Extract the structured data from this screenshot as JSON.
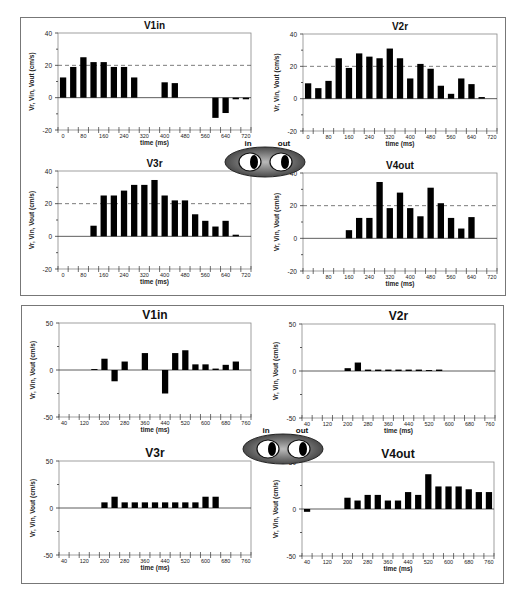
{
  "panels": [
    {
      "id": "top",
      "frame": {
        "x": 20,
        "y": 17,
        "w": 486,
        "h": 279
      },
      "eyes": {
        "x": 222,
        "y": 138,
        "in_label": "in",
        "out_label": "out"
      },
      "ylim": [
        -20,
        40
      ],
      "yticks": [
        -20,
        0,
        20,
        40
      ],
      "xticks": [
        "0",
        "80",
        "160",
        "240",
        "320",
        "400",
        "480",
        "560",
        "640",
        "720"
      ],
      "reference_line": 20
    },
    {
      "id": "bottom",
      "frame": {
        "x": 21,
        "y": 305,
        "w": 483,
        "h": 279
      },
      "eyes": {
        "x": 240,
        "y": 425,
        "in_label": "in",
        "out_label": "out"
      },
      "ylim": [
        -50,
        50
      ],
      "yticks": [
        -50,
        0,
        50
      ],
      "xticks": [
        "40",
        "120",
        "200",
        "280",
        "360",
        "440",
        "520",
        "600",
        "680",
        "760"
      ],
      "reference_line": null
    }
  ],
  "chart_data": [
    {
      "type": "bar",
      "panel": "top",
      "title": "V1in",
      "xlabel": "time (ms)",
      "ylabel": "Vr, Vin, Vout (cm/s)",
      "ylim": [
        -20,
        40
      ],
      "reference_line": 20,
      "x": [
        0,
        40,
        80,
        120,
        160,
        200,
        240,
        280,
        320,
        360,
        400,
        440,
        480,
        520,
        560,
        600,
        640,
        680,
        720
      ],
      "values": [
        12.5,
        19,
        25,
        22,
        22,
        19,
        19,
        12.5,
        0,
        0,
        9.5,
        9,
        0,
        0,
        0,
        -12.5,
        -9.5,
        -1,
        -1
      ],
      "box": {
        "x": 58,
        "y": 33,
        "w": 193,
        "h": 97
      }
    },
    {
      "type": "bar",
      "panel": "top",
      "title": "V2r",
      "xlabel": "time (ms)",
      "ylabel": "Vr, Vin, Vout (cm/s)",
      "ylim": [
        -20,
        40
      ],
      "reference_line": 20,
      "x": [
        0,
        40,
        80,
        120,
        160,
        200,
        240,
        280,
        320,
        360,
        400,
        440,
        480,
        520,
        560,
        600,
        640,
        680,
        720
      ],
      "values": [
        9.5,
        6.5,
        11,
        25,
        19,
        28,
        26,
        25,
        31,
        25,
        12.5,
        21.5,
        18.5,
        8,
        3,
        12.5,
        9,
        1,
        0
      ],
      "box": {
        "x": 303,
        "y": 34,
        "w": 194,
        "h": 97
      }
    },
    {
      "type": "bar",
      "panel": "top",
      "title": "V3r",
      "xlabel": "time (ms)",
      "ylabel": "Vr, Vin, Vout (cm/s)",
      "ylim": [
        -20,
        40
      ],
      "reference_line": 20,
      "x": [
        0,
        40,
        80,
        120,
        160,
        200,
        240,
        280,
        320,
        360,
        400,
        440,
        480,
        520,
        560,
        600,
        640,
        680,
        720
      ],
      "values": [
        0,
        0,
        0,
        6.5,
        25,
        25,
        28,
        31.5,
        31.5,
        34.5,
        25,
        22,
        22,
        13.5,
        9.5,
        6,
        9.5,
        1,
        0
      ],
      "box": {
        "x": 58,
        "y": 171,
        "w": 193,
        "h": 98
      }
    },
    {
      "type": "bar",
      "panel": "top",
      "title": "V4out",
      "xlabel": "time (ms)",
      "ylabel": "Vr, Vin, Vout (cm/s)",
      "ylim": [
        -20,
        40
      ],
      "reference_line": 20,
      "x": [
        0,
        40,
        80,
        120,
        160,
        200,
        240,
        280,
        320,
        360,
        400,
        440,
        480,
        520,
        560,
        600,
        640,
        680,
        720
      ],
      "values": [
        0,
        0,
        0,
        0,
        5,
        12.5,
        12.5,
        34.5,
        18.5,
        28,
        18.5,
        13.5,
        31,
        21.5,
        12.5,
        6,
        13,
        0,
        0
      ],
      "box": {
        "x": 303,
        "y": 173,
        "w": 194,
        "h": 98
      }
    },
    {
      "type": "bar",
      "panel": "bottom",
      "title": "V1in",
      "xlabel": "time (ms)",
      "ylabel": "Vr, Vin, Vout (cm/s)",
      "ylim": [
        -50,
        50
      ],
      "reference_line": null,
      "x": [
        40,
        80,
        120,
        160,
        200,
        240,
        280,
        320,
        360,
        400,
        440,
        480,
        520,
        560,
        600,
        640,
        680,
        720,
        760
      ],
      "values": [
        0,
        0,
        0,
        1,
        12,
        -12,
        9,
        0,
        18,
        0,
        -25,
        18,
        21,
        6,
        6,
        1.5,
        5.5,
        9,
        0
      ],
      "box": {
        "x": 59,
        "y": 323,
        "w": 192,
        "h": 94
      }
    },
    {
      "type": "bar",
      "panel": "bottom",
      "title": "V2r",
      "xlabel": "time (ms)",
      "ylabel": "Vr, Vin, Vout (cm/s)",
      "ylim": [
        -50,
        50
      ],
      "reference_line": null,
      "x": [
        40,
        80,
        120,
        160,
        200,
        240,
        280,
        320,
        360,
        400,
        440,
        480,
        520,
        560,
        600,
        640,
        680,
        720,
        760
      ],
      "values": [
        0,
        0,
        0,
        0,
        3,
        9,
        1.5,
        1.5,
        1.5,
        1.5,
        1.5,
        1.5,
        1,
        1.5,
        0,
        0,
        0,
        0,
        0
      ],
      "box": {
        "x": 302,
        "y": 324,
        "w": 193,
        "h": 94
      }
    },
    {
      "type": "bar",
      "panel": "bottom",
      "title": "V3r",
      "xlabel": "time (ms)",
      "ylabel": "Vr, Vin, Vout (cm/s)",
      "ylim": [
        -50,
        50
      ],
      "reference_line": null,
      "x": [
        40,
        80,
        120,
        160,
        200,
        240,
        280,
        320,
        360,
        400,
        440,
        480,
        520,
        560,
        600,
        640,
        680,
        720,
        760
      ],
      "values": [
        0,
        0,
        0,
        0,
        6,
        12,
        6,
        6,
        6,
        6,
        6,
        6,
        6,
        6,
        12,
        12,
        0,
        0,
        0
      ],
      "box": {
        "x": 59,
        "y": 461,
        "w": 192,
        "h": 94
      }
    },
    {
      "type": "bar",
      "panel": "bottom",
      "title": "V4out",
      "xlabel": "time (ms)",
      "ylabel": "Vr, Vin, Vout (cm/s)",
      "ylim": [
        -50,
        50
      ],
      "reference_line": null,
      "x": [
        40,
        80,
        120,
        160,
        200,
        240,
        280,
        320,
        360,
        400,
        440,
        480,
        520,
        560,
        600,
        640,
        680,
        720,
        760
      ],
      "values": [
        -3,
        0,
        0,
        0,
        12,
        9,
        15,
        15,
        9,
        9,
        18,
        15,
        37,
        24,
        24,
        24,
        21,
        18,
        18
      ],
      "box": {
        "x": 302,
        "y": 462,
        "w": 192,
        "h": 94
      }
    }
  ],
  "caption": "Fig. … (text cut off at bottom edge)"
}
